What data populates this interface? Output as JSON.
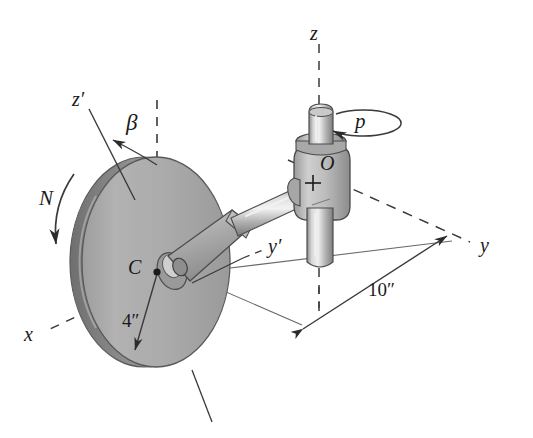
{
  "figure": {
    "background_color": "#ffffff",
    "line_color": "#2b2b2b",
    "disk_fill": "#a9a9a9",
    "disk_rim_fill": "#8f8f8f",
    "metal_light": "#e2e2e2",
    "metal_mid": "#b6b6b6",
    "metal_dark": "#7d7d7d"
  },
  "labels": {
    "z_axis": "z",
    "z_prime_axis": "z′",
    "y_axis": "y",
    "y_prime_axis": "y′",
    "x_axis": "x",
    "beta_angle": "β",
    "spin_rate": "N",
    "precession_rate": "p",
    "center_point": "C",
    "origin_point": "O"
  },
  "dimensions": {
    "disk_radius": "4″",
    "arm_length": "10″"
  }
}
